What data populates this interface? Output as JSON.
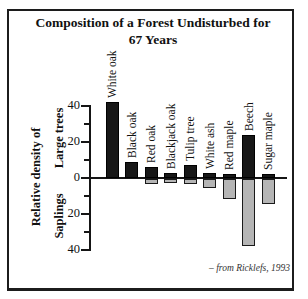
{
  "title": {
    "line1": "Composition of a Forest Undisturbed for",
    "line2": "67 Years"
  },
  "y_axis": {
    "label_main": "Relative density of",
    "label_upper": "Large trees",
    "label_lower": "Saplings",
    "major_ticks": [
      {
        "value": 40,
        "label": "40"
      },
      {
        "value": 20,
        "label": "20"
      },
      {
        "value": 0,
        "label": "0"
      },
      {
        "value": -20,
        "label": "20"
      },
      {
        "value": -40,
        "label": "40"
      }
    ],
    "minor_tick_values": [
      30,
      10,
      -10,
      -30
    ]
  },
  "chart_data": {
    "type": "bar",
    "subtype": "diverging-vertical",
    "title": "Composition of a Forest Undisturbed for 67 Years",
    "ylabel": "Relative density of Large trees (above axis) and Saplings (below axis)",
    "ylim": [
      -40,
      44
    ],
    "grid": false,
    "categories": [
      "White oak",
      "Black oak",
      "Red oak",
      "Blackjack oak",
      "Tulip tree",
      "White ash",
      "Red maple",
      "Beech",
      "Sugar maple"
    ],
    "series": [
      {
        "name": "Large trees",
        "direction": "up",
        "color": "#171717",
        "values": [
          42,
          9,
          6,
          3,
          7,
          3,
          2,
          24,
          0
        ]
      },
      {
        "name": "Saplings",
        "direction": "down",
        "color": "#b5b5b5",
        "values": [
          0,
          0,
          3,
          2,
          3,
          5,
          11,
          37,
          14
        ]
      }
    ],
    "note_small_tops": "Sugar maple shows only a ~2-unit black cap above axis",
    "sugar_maple_large_trees": 2
  },
  "attribution": "– from Ricklefs, 1993",
  "colors": {
    "large_trees_bar": "#171717",
    "saplings_bar": "#b5b5b5",
    "axis": "#151515",
    "frame_border": "#1c1c1c",
    "background": "#ffffff"
  }
}
